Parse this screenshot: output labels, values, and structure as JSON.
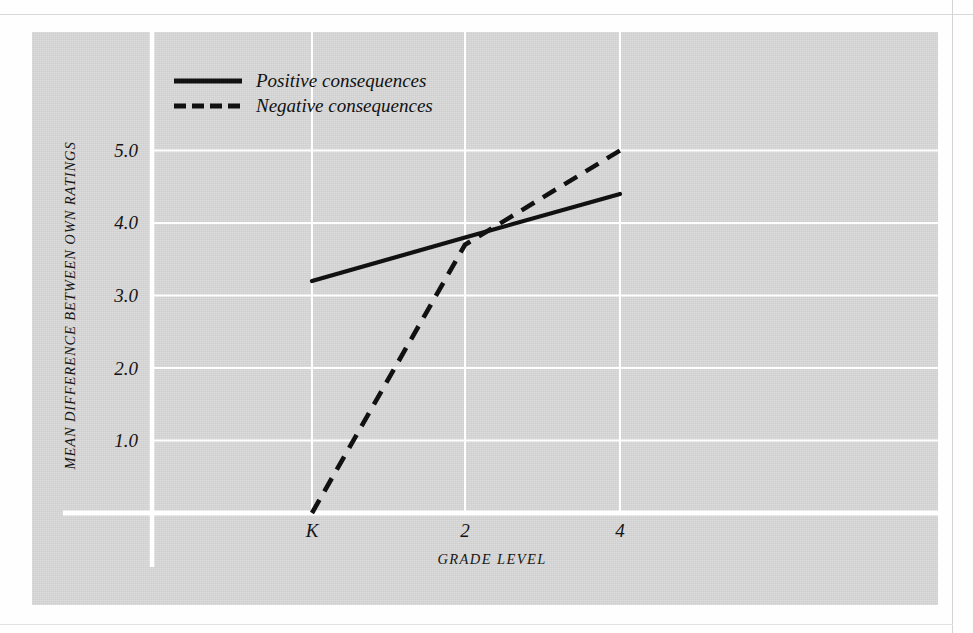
{
  "chart_data": {
    "type": "line",
    "title": "",
    "xlabel": "GRADE LEVEL",
    "ylabel": "MEAN DIFFERENCE BETWEEN OWN RATINGS",
    "x": [
      "K",
      "2",
      "4"
    ],
    "x_tick_labels": [
      "K",
      "2",
      "4"
    ],
    "y_tick_labels": [
      "1.0",
      "2.0",
      "3.0",
      "4.0",
      "5.0"
    ],
    "y_ticks": [
      1.0,
      2.0,
      3.0,
      4.0,
      5.0
    ],
    "ylim": [
      0.0,
      5.6
    ],
    "grid": true,
    "grid_color": "#ffffff",
    "legend_position": "top-left",
    "series": [
      {
        "name": "Positive consequences",
        "style": "solid",
        "color": "#111111",
        "values": [
          3.2,
          3.8,
          4.4
        ]
      },
      {
        "name": "Negative consequences",
        "style": "dashed",
        "color": "#111111",
        "values": [
          0.0,
          3.7,
          5.0
        ]
      }
    ]
  },
  "axes": {
    "y_tick_labels": [
      {
        "text": "5.0",
        "top": 140
      },
      {
        "text": "4.0",
        "top": 212
      },
      {
        "text": "3.0",
        "top": 285
      },
      {
        "text": "2.0",
        "top": 358
      },
      {
        "text": "1.0",
        "top": 430
      }
    ],
    "x_tick_labels": [
      {
        "text": "K",
        "left": 292
      },
      {
        "text": "2",
        "left": 445
      },
      {
        "text": "4",
        "left": 600
      }
    ],
    "ylabel": "MEAN DIFFERENCE BETWEEN OWN RATINGS",
    "xlabel": "GRADE LEVEL"
  },
  "legend": {
    "items": [
      {
        "label": "Positive consequences",
        "style": "solid"
      },
      {
        "label": "Negative consequences",
        "style": "dashed"
      }
    ]
  },
  "colors": {
    "panel_background": "#d5d5d5",
    "page_background": "#fefefe",
    "gridline": "#ffffff",
    "axis_spine": "#ffffff",
    "series_line": "#111111",
    "text": "#141414"
  }
}
